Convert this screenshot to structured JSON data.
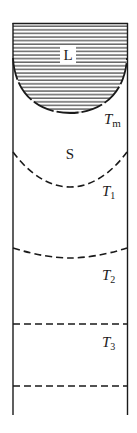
{
  "diagram": {
    "type": "zone-refining-column",
    "colors": {
      "line": "#1a1a1a",
      "background": "#ffffff",
      "hatch": "#333333"
    },
    "regions": [
      {
        "id": "liquid",
        "label": "L",
        "hatched": true
      },
      {
        "id": "solid",
        "label": "S",
        "hatched": false
      }
    ],
    "isotherms": [
      {
        "id": "Tm",
        "symbol": "T",
        "subscript": "m",
        "shape": "curve"
      },
      {
        "id": "T1",
        "symbol": "T",
        "subscript": "1",
        "shape": "curve"
      },
      {
        "id": "T2",
        "symbol": "T",
        "subscript": "2",
        "shape": "shallow-curve"
      },
      {
        "id": "T3",
        "symbol": "T",
        "subscript": "3",
        "shape": "flat"
      }
    ],
    "bottom_boundary": {
      "style": "dashed",
      "shape": "flat"
    }
  },
  "labels": {
    "L": "L",
    "S": "S",
    "Tm_main": "T",
    "Tm_sub": "m",
    "T1_main": "T",
    "T1_sub": "1",
    "T2_main": "T",
    "T2_sub": "2",
    "T3_main": "T",
    "T3_sub": "3"
  }
}
